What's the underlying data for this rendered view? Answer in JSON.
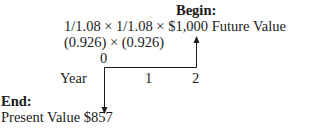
{
  "diagram": {
    "begin_label": "Begin:",
    "formula": "1/1.08 × 1/1.08 × $1,000 Future Value",
    "factors": "(0.926) × (0.926)",
    "timeline": {
      "axis_label": "Year",
      "ticks": [
        "0",
        "1",
        "2"
      ]
    },
    "end_label": "End:",
    "result": "Present Value $857"
  }
}
